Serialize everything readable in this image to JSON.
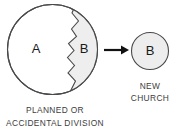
{
  "diagram": {
    "type": "church-division-diagram",
    "background_color": "#ffffff",
    "original_whole": {
      "label": "A",
      "outline_color": "#4a4a4a",
      "fill_color": "#ffffff",
      "center": {
        "x": 52.5,
        "y": 49.5
      },
      "radius": 45.5
    },
    "split_off_segment": {
      "label": "B",
      "fill_color": "#eeeeee",
      "outline_color": "#4a4a4a",
      "boundary_style": "jagged"
    },
    "arrow": {
      "name": "right-arrow",
      "color": "#111111",
      "direction": "right",
      "x_start": 104,
      "x_end": 128,
      "y": 50
    },
    "result_circle": {
      "label": "B",
      "fill_color": "#ededed",
      "outline_color": "#4a4a4a",
      "center": {
        "x": 150,
        "y": 51
      },
      "radius": 19
    },
    "captions": {
      "left": {
        "name": "planned-or-accidental-division-caption",
        "lines": [
          "PLANNED OR",
          "ACCIDENTAL DIVISION"
        ],
        "color": "#3d3d3d"
      },
      "right": {
        "name": "new-church-caption",
        "lines": [
          "NEW",
          "CHURCH"
        ],
        "color": "#3d3d3d"
      }
    }
  }
}
